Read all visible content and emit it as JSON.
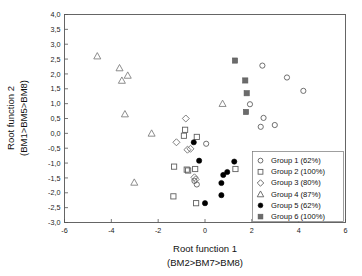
{
  "chart_data": {
    "type": "scatter",
    "title": "",
    "xlabel": "Root function 1",
    "xlabel_sub": "(BM2>BM7>BM8)",
    "ylabel": "Root function 2",
    "ylabel_sub": "(BM1>BM5>BM8)",
    "xlim": [
      -6,
      6
    ],
    "ylim": [
      -3.0,
      4.0
    ],
    "xticks": [
      -6,
      -4,
      -2,
      0,
      2,
      4,
      6
    ],
    "xtick_labels": [
      "-6",
      "-4",
      "-2",
      "0",
      "2",
      "4",
      "6"
    ],
    "yticks": [
      4.0,
      3.5,
      3.0,
      2.5,
      2.0,
      1.5,
      1.0,
      0.5,
      0.0,
      -0.5,
      -1.0,
      -1.5,
      -2.0,
      -2.5,
      -3.0
    ],
    "ytick_labels": [
      "4,0",
      "3,5",
      "3,0",
      "2,5",
      "2,0",
      "1,5",
      "1,0",
      "0,5",
      "0,0",
      "-0,5",
      "-1,0",
      "-1,5",
      "-2,0",
      "-2,5",
      "-3,0"
    ],
    "grid": false,
    "legend_position": "lower-right",
    "decimal_separator": ",",
    "series": [
      {
        "name": "Group 1 (62%)",
        "marker": "open-circle",
        "color": "#606060",
        "points": [
          [
            0.05,
            -0.35
          ],
          [
            2.45,
            2.28
          ],
          [
            3.5,
            1.88
          ],
          [
            4.2,
            1.43
          ],
          [
            2.5,
            0.52
          ],
          [
            2.38,
            0.22
          ],
          [
            2.98,
            0.28
          ],
          [
            1.92,
            0.98
          ],
          [
            -0.45,
            -1.6
          ],
          [
            -0.35,
            -1.72
          ]
        ]
      },
      {
        "name": "Group 2 (100%)",
        "marker": "open-square",
        "color": "#606060",
        "points": [
          [
            -0.85,
            0.12
          ],
          [
            -0.35,
            -0.12
          ],
          [
            -0.78,
            -1.22
          ],
          [
            -0.42,
            -1.2
          ],
          [
            -1.32,
            -1.12
          ],
          [
            -1.35,
            -2.12
          ],
          [
            -0.38,
            -2.35
          ],
          [
            1.3,
            -1.2
          ],
          [
            -0.9,
            -0.08
          ],
          [
            -0.72,
            -1.25
          ]
        ]
      },
      {
        "name": "Group 3 (80%)",
        "marker": "open-diamond",
        "color": "#707070",
        "points": [
          [
            -0.82,
            0.5
          ],
          [
            -1.22,
            -0.3
          ],
          [
            -0.75,
            -0.55
          ],
          [
            -0.62,
            -0.52
          ],
          [
            -0.45,
            -1.48
          ],
          [
            -0.4,
            -1.55
          ]
        ]
      },
      {
        "name": "Group 4 (87%)",
        "marker": "open-triangle",
        "color": "#808080",
        "points": [
          [
            -4.6,
            2.6
          ],
          [
            -3.65,
            2.2
          ],
          [
            -3.55,
            1.78
          ],
          [
            -3.3,
            1.95
          ],
          [
            -3.42,
            0.65
          ],
          [
            -2.28,
            0.0
          ],
          [
            -3.02,
            -1.65
          ],
          [
            0.75,
            1.0
          ]
        ]
      },
      {
        "name": "Group 5 (62%)",
        "marker": "filled-circle",
        "color": "#000000",
        "points": [
          [
            -0.48,
            -0.3
          ],
          [
            -0.25,
            -0.92
          ],
          [
            0.7,
            -1.67
          ],
          [
            0.78,
            -1.4
          ],
          [
            0.95,
            -1.3
          ],
          [
            0.7,
            -2.08
          ],
          [
            0.0,
            -2.35
          ],
          [
            1.25,
            -0.95
          ]
        ]
      },
      {
        "name": "Group 6 (100%)",
        "marker": "filled-square-gray",
        "color": "#606060",
        "points": [
          [
            1.28,
            2.45
          ],
          [
            1.72,
            1.78
          ],
          [
            1.78,
            1.35
          ],
          [
            1.75,
            0.72
          ]
        ]
      }
    ]
  },
  "legend": {
    "entries": [
      {
        "label": "Group 1 (62%)",
        "marker": "open-circle"
      },
      {
        "label": "Group 2 (100%)",
        "marker": "open-square"
      },
      {
        "label": "Group 3 (80%)",
        "marker": "open-diamond"
      },
      {
        "label": "Group 4 (87%)",
        "marker": "open-triangle"
      },
      {
        "label": "Group 5 (62%)",
        "marker": "filled-circle-black"
      },
      {
        "label": "Group 6 (100%)",
        "marker": "filled-square-gray"
      }
    ]
  }
}
